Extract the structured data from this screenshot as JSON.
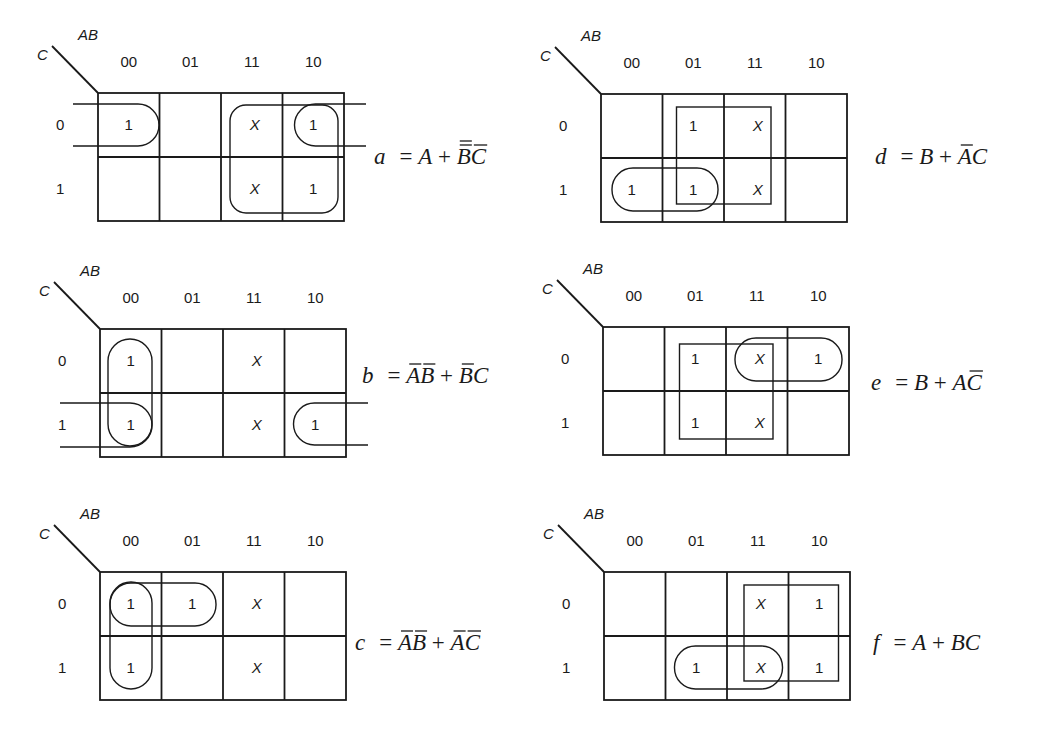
{
  "figure": {
    "column_labels": [
      "00",
      "01",
      "11",
      "10"
    ],
    "row_labels": [
      "0",
      "1"
    ],
    "column_variables": "AB",
    "row_variable": "C",
    "maps": [
      {
        "id": "a",
        "origin": [
          98,
          93
        ],
        "cells": [
          [
            "1",
            "",
            "X",
            "1"
          ],
          [
            "",
            "",
            "X",
            "1"
          ]
        ],
        "equation": {
          "name": "a",
          "terms": [
            [
              {
                "v": "A",
                "bar": 0
              }
            ],
            [
              {
                "v": "B",
                "bar": 2
              },
              {
                "v": "C",
                "bar": 1
              }
            ]
          ]
        },
        "equation_pos": [
          374,
          164
        ],
        "groups": [
          {
            "type": "wrap-h",
            "desc": "A'B'C' wrapped with AB'C' (row 0, columns 00 and 10)"
          },
          {
            "type": "rounded",
            "desc": "A (columns 11,10, both rows)"
          }
        ]
      },
      {
        "id": "d",
        "origin": [
          601,
          94
        ],
        "cells": [
          [
            "",
            "1",
            "X",
            ""
          ],
          [
            "1",
            "1",
            "X",
            ""
          ]
        ],
        "equation": {
          "name": "d",
          "terms": [
            [
              {
                "v": "B",
                "bar": 0
              }
            ],
            [
              {
                "v": "A",
                "bar": 1
              },
              {
                "v": "C",
                "bar": 0
              }
            ]
          ]
        },
        "equation_pos": [
          875,
          164
        ],
        "groups": [
          {
            "type": "square",
            "desc": "B (columns 01,11, both rows)"
          },
          {
            "type": "rounded",
            "desc": "A'C (row 1, columns 00,01)"
          }
        ]
      },
      {
        "id": "b",
        "origin": [
          100,
          329
        ],
        "cells": [
          [
            "1",
            "",
            "X",
            ""
          ],
          [
            "1",
            "",
            "X",
            "1"
          ]
        ],
        "equation": {
          "name": "b",
          "terms": [
            [
              {
                "v": "A",
                "bar": 1
              },
              {
                "v": "B",
                "bar": 1
              }
            ],
            [
              {
                "v": "B",
                "bar": 1
              },
              {
                "v": "C",
                "bar": 0
              }
            ]
          ]
        },
        "equation_pos": [
          362,
          383
        ],
        "groups": [
          {
            "type": "rounded",
            "desc": "A'B' (column 00, both rows)"
          },
          {
            "type": "wrap-h",
            "desc": "B'C (row 1, columns 00 and 10 wrapped)"
          }
        ]
      },
      {
        "id": "e",
        "origin": [
          603,
          327
        ],
        "cells": [
          [
            "",
            "1",
            "X",
            "1"
          ],
          [
            "",
            "1",
            "X",
            ""
          ]
        ],
        "equation": {
          "name": "e",
          "terms": [
            [
              {
                "v": "B",
                "bar": 0
              }
            ],
            [
              {
                "v": "A",
                "bar": 0
              },
              {
                "v": "C",
                "bar": 1
              }
            ]
          ]
        },
        "equation_pos": [
          871,
          390
        ],
        "groups": [
          {
            "type": "square",
            "desc": "B (columns 01,11, both rows)"
          },
          {
            "type": "rounded",
            "desc": "AC' (row 0, columns 11,10)"
          }
        ]
      },
      {
        "id": "c",
        "origin": [
          100,
          572
        ],
        "cells": [
          [
            "1",
            "1",
            "X",
            ""
          ],
          [
            "1",
            "",
            "X",
            ""
          ]
        ],
        "equation": {
          "name": "c",
          "terms": [
            [
              {
                "v": "A",
                "bar": 1
              },
              {
                "v": "B",
                "bar": 1
              }
            ],
            [
              {
                "v": "A",
                "bar": 1
              },
              {
                "v": "C",
                "bar": 1
              }
            ]
          ]
        },
        "equation_pos": [
          355,
          650
        ],
        "groups": [
          {
            "type": "rounded",
            "desc": "A'B' (column 00, both rows)"
          },
          {
            "type": "rounded",
            "desc": "A'C' (row 0, columns 00,01)"
          }
        ]
      },
      {
        "id": "f",
        "origin": [
          604,
          572
        ],
        "cells": [
          [
            "",
            "",
            "X",
            "1"
          ],
          [
            "",
            "1",
            "X",
            "1"
          ]
        ],
        "equation": {
          "name": "f",
          "terms": [
            [
              {
                "v": "A",
                "bar": 0
              }
            ],
            [
              {
                "v": "B",
                "bar": 0
              },
              {
                "v": "C",
                "bar": 0
              }
            ]
          ]
        },
        "equation_pos": [
          873,
          650
        ],
        "groups": [
          {
            "type": "square",
            "desc": "A (columns 11,10, both rows)"
          },
          {
            "type": "rounded",
            "desc": "BC (row 1, columns 01,11)"
          }
        ]
      }
    ]
  }
}
